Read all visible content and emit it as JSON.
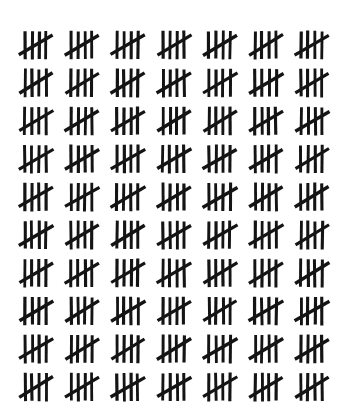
{
  "image": {
    "title": "Tally Mark Count Sheet",
    "background_color": "#ffffff",
    "stroke_color": "#141414",
    "width": 343,
    "height": 419
  },
  "chart_data": {
    "type": "bar",
    "subtitle": "Hand-drawn five-bar gate tally marks",
    "xlabel": "",
    "ylabel": "",
    "grid": false,
    "legend": "none",
    "notation": "five-bar-gate",
    "marks_per_group": 5,
    "group_symbol": "IIII crossed by diagonal",
    "categories": [
      "Row 1",
      "Row 2",
      "Row 3",
      "Row 4",
      "Row 5",
      "Row 6",
      "Row 7",
      "Row 8",
      "Row 9",
      "Row 10"
    ],
    "values": [
      35,
      35,
      35,
      35,
      35,
      35,
      35,
      35,
      35,
      25
    ],
    "groups_per_row": [
      7,
      7,
      7,
      7,
      7,
      7,
      7,
      7,
      7,
      5
    ],
    "total_groups": 68,
    "total_count": 340,
    "ylim": [
      0,
      35
    ]
  },
  "layout": {
    "rows": 10,
    "columns": 7,
    "full_rows": 9,
    "groups_in_full_row": 7,
    "groups_in_last_row": 5,
    "origin_x": 12,
    "origin_y": 26,
    "column_pitch": 46,
    "row_pitch": 38
  },
  "glyph": {
    "name": "tally-group-five",
    "vertical_strokes": 4,
    "diagonal_strokes": 1,
    "stroke_width": 3.0,
    "vertical_x": [
      13,
      20,
      27,
      34
    ],
    "vertical_y_top": 5,
    "vertical_y_bottom": 33,
    "diagonal_x1": 7,
    "diagonal_y1": 29,
    "diagonal_x2": 41,
    "diagonal_y2": 9
  }
}
